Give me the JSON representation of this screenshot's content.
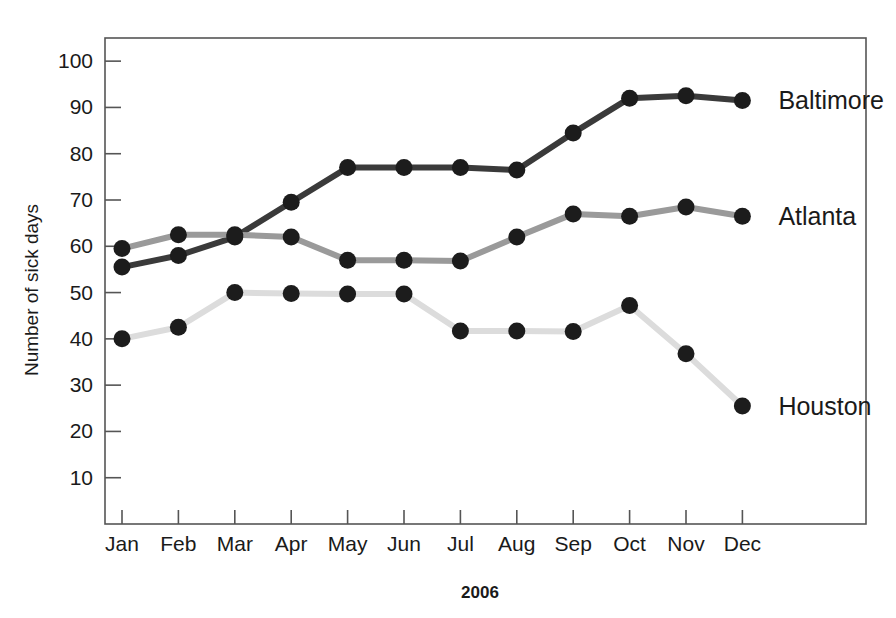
{
  "chart_data": {
    "type": "line",
    "title": "",
    "xlabel": "2006",
    "ylabel": "Number of sick days",
    "categories": [
      "Jan",
      "Feb",
      "Mar",
      "Apr",
      "May",
      "Jun",
      "Jul",
      "Aug",
      "Sep",
      "Oct",
      "Nov",
      "Dec"
    ],
    "ylim": [
      0,
      105
    ],
    "y_ticks": [
      10,
      20,
      30,
      40,
      50,
      60,
      70,
      80,
      90,
      100
    ],
    "grid": false,
    "legend_position": "right-inline-labels",
    "series": [
      {
        "name": "Baltimore",
        "color": "#3a3a3a",
        "marker_color": "#1c1c1c",
        "values": [
          55.5,
          58,
          62,
          69.5,
          77,
          77,
          77,
          76.5,
          84.5,
          92,
          92.5,
          91.5
        ]
      },
      {
        "name": "Atlanta",
        "color": "#9a9a9a",
        "marker_color": "#1c1c1c",
        "values": [
          59.5,
          62.5,
          62.5,
          62,
          57,
          57,
          56.8,
          62,
          67,
          66.5,
          68.5,
          66.5
        ]
      },
      {
        "name": "Houston",
        "color": "#dcdcdc",
        "marker_color": "#1c1c1c",
        "values": [
          40,
          42.5,
          50,
          49.8,
          49.7,
          49.7,
          41.7,
          41.7,
          41.6,
          47.2,
          36.8,
          25.5
        ]
      }
    ]
  },
  "axes": {
    "y_tick_labels": [
      "10",
      "20",
      "30",
      "40",
      "50",
      "60",
      "70",
      "80",
      "90",
      "100"
    ],
    "x_tick_labels": [
      "Jan",
      "Feb",
      "Mar",
      "Apr",
      "May",
      "Jun",
      "Jul",
      "Aug",
      "Sep",
      "Oct",
      "Nov",
      "Dec"
    ],
    "x_axis_title": "2006",
    "y_axis_title": "Number of sick days"
  },
  "series_labels": {
    "baltimore": "Baltimore",
    "atlanta": "Atlanta",
    "houston": "Houston"
  }
}
